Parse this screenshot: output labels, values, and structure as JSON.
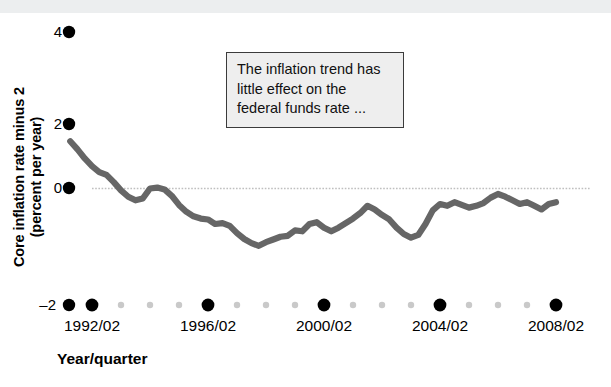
{
  "figure": {
    "background_color": "#ffffff",
    "top_band_color": "#eceeef",
    "series_color": "#666666",
    "gridline_color": "#bfbfbf",
    "tick_major_color": "#000000",
    "tick_minor_color": "#c9c9c9",
    "annotation_bg": "#eeeeee",
    "annotation_border": "#3b3b3b"
  },
  "annotation": {
    "name": "inflation-trend-callout",
    "lines": [
      "The inflation trend has",
      "little effect on the",
      "federal funds rate ..."
    ],
    "full_text": "The inflation trend has little effect on the federal funds rate ..."
  },
  "axes": {
    "y_title_lines": [
      "Core inflation rate minus 2",
      "(percent per year)"
    ],
    "y_title": "Core inflation rate minus 2 (percent per year)",
    "x_title": "Year/quarter",
    "y_ticks": [
      "4",
      "2",
      "0",
      "–2"
    ],
    "x_ticks": [
      "1992/02",
      "1996/02",
      "2000/02",
      "2004/02",
      "2008/02"
    ]
  },
  "chart_data": {
    "type": "line",
    "title": "",
    "xlabel": "Year/quarter",
    "ylabel": "Core inflation rate minus 2 (percent per year)",
    "ylim": [
      -2,
      4
    ],
    "xlim": [
      1991.25,
      2008.5
    ],
    "ytick_values": [
      4,
      2,
      0,
      -2
    ],
    "xtick_labels": [
      "1992/02",
      "1996/02",
      "2000/02",
      "2004/02",
      "2008/02"
    ],
    "xtick_values": [
      1992.25,
      1996.25,
      2000.25,
      2004.25,
      2008.25
    ],
    "grid": "zero-line-only",
    "legend": "none",
    "series": [
      {
        "name": "Core inflation rate minus 2",
        "color": "#666666",
        "x": [
          1991.5,
          1991.75,
          1992.0,
          1992.25,
          1992.5,
          1992.75,
          1993.0,
          1993.25,
          1993.5,
          1993.75,
          1994.0,
          1994.25,
          1994.5,
          1994.75,
          1995.0,
          1995.25,
          1995.5,
          1995.75,
          1996.0,
          1996.25,
          1996.5,
          1996.75,
          1997.0,
          1997.25,
          1997.5,
          1997.75,
          1998.0,
          1998.25,
          1998.5,
          1998.75,
          1999.0,
          1999.25,
          1999.5,
          1999.75,
          2000.0,
          2000.25,
          2000.5,
          2000.75,
          2001.0,
          2001.25,
          2001.5,
          2001.75,
          2002.0,
          2002.25,
          2002.5,
          2002.75,
          2003.0,
          2003.25,
          2003.5,
          2003.75,
          2004.0,
          2004.25,
          2004.5,
          2004.75,
          2005.0,
          2005.25,
          2005.5,
          2005.75,
          2006.0,
          2006.25,
          2006.5,
          2006.75,
          2007.0,
          2007.25,
          2007.5,
          2007.75,
          2008.0,
          2008.25
        ],
        "y": [
          1.6,
          1.42,
          1.22,
          1.05,
          0.92,
          0.86,
          0.7,
          0.52,
          0.38,
          0.3,
          0.34,
          0.56,
          0.58,
          0.54,
          0.4,
          0.2,
          0.05,
          -0.05,
          -0.1,
          -0.12,
          -0.22,
          -0.2,
          -0.26,
          -0.42,
          -0.55,
          -0.64,
          -0.7,
          -0.62,
          -0.56,
          -0.5,
          -0.48,
          -0.36,
          -0.38,
          -0.22,
          -0.18,
          -0.3,
          -0.38,
          -0.3,
          -0.2,
          -0.1,
          0.02,
          0.18,
          0.1,
          -0.02,
          -0.12,
          -0.3,
          -0.44,
          -0.52,
          -0.46,
          -0.22,
          0.08,
          0.22,
          0.18,
          0.26,
          0.2,
          0.14,
          0.18,
          0.24,
          0.36,
          0.44,
          0.38,
          0.3,
          0.22,
          0.26,
          0.18,
          0.1,
          0.22,
          0.26
        ]
      }
    ]
  }
}
